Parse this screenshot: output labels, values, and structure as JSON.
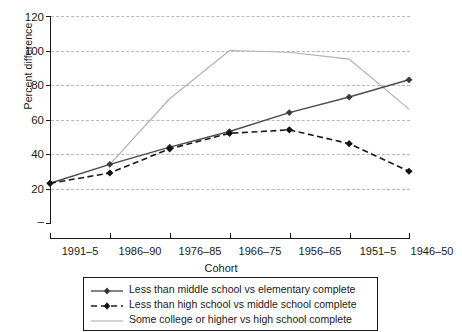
{
  "chart_data": {
    "type": "line",
    "title": "",
    "xlabel": "Cohort",
    "ylabel": "Percent difference",
    "categories": [
      "1991–5",
      "1986–90",
      "1976–85",
      "1966–75",
      "1956–65",
      "1951–5",
      "1946–50"
    ],
    "ylim": [
      0,
      120
    ],
    "yticks": [
      0,
      20,
      40,
      60,
      80,
      100,
      120
    ],
    "ytick_labels": [
      "",
      "20",
      "40",
      "60",
      "80",
      "100",
      "120"
    ],
    "grid": true,
    "legend_position": "below-plot",
    "series": [
      {
        "name": "Less than middle school vs elementary complete",
        "style": "solid-with-diamond-markers",
        "color": "#4d4d4d",
        "values": [
          23,
          34,
          44,
          53,
          64,
          73,
          83
        ]
      },
      {
        "name": "Less than high school vs middle school complete",
        "style": "dashed-with-diamond-markers",
        "color": "#1a1a1a",
        "values": [
          23,
          29,
          43,
          52,
          54,
          46,
          30
        ]
      },
      {
        "name": "Some college or higher vs high school complete",
        "style": "thin-solid-grey",
        "color": "#b0b0b0",
        "values": [
          null,
          34,
          72,
          100,
          99,
          95,
          66
        ]
      }
    ]
  },
  "axes": {
    "y_title": "Percent difference",
    "x_title": "Cohort",
    "y_tick_0": "",
    "y_tick_20": "20",
    "y_tick_40": "40",
    "y_tick_60": "60",
    "y_tick_80": "80",
    "y_tick_100": "100",
    "y_tick_120": "120",
    "x_tick_0": "1991–5",
    "x_tick_1": "1986–90",
    "x_tick_2": "1976–85",
    "x_tick_3": "1966–75",
    "x_tick_4": "1956–65",
    "x_tick_5": "1951–5",
    "x_tick_6": "1946–50"
  },
  "legend": {
    "items": [
      {
        "label": "Less than middle school vs elementary complete"
      },
      {
        "label": "Less than high school vs middle school complete"
      },
      {
        "label": "Some college or higher vs high school complete"
      }
    ]
  }
}
